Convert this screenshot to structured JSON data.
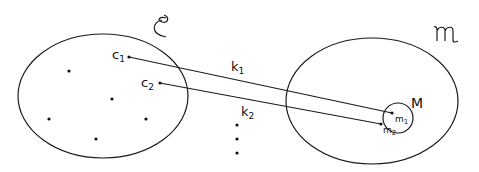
{
  "diagram": {
    "left_set": {
      "symbol": "𝒞",
      "points": [
        {
          "label": "c",
          "sub": "1"
        },
        {
          "label": "c",
          "sub": "2"
        }
      ],
      "unlabeled_point_count": 5
    },
    "right_set": {
      "symbol": "𝔐",
      "subset": {
        "label": "M",
        "points": [
          {
            "label": "m",
            "sub": "1"
          },
          {
            "label": "m",
            "sub": "2"
          }
        ]
      }
    },
    "mappings": [
      {
        "label": "k",
        "sub": "1",
        "from": "c1",
        "to": "m1"
      },
      {
        "label": "k",
        "sub": "2",
        "from": "c2",
        "to": "m2"
      }
    ],
    "continuation": "⋮",
    "stroke_color": "#1a1a1a",
    "background_color": "#ffffff"
  }
}
